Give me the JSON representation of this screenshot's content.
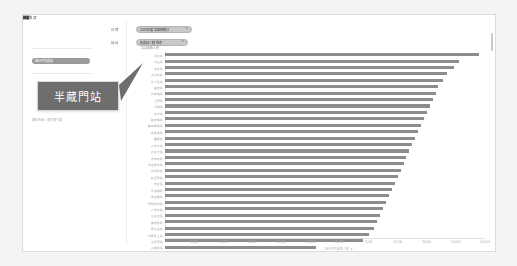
{
  "app": {
    "background_color": "#f4f4f4",
    "card_background": "#ffffff",
    "bar_color": "#8d8d8d",
    "tooltip_background": "#6e6e6e",
    "accent_color": "#9a9a9a"
  },
  "filters": {
    "label_1": "篩選",
    "label_2": "測量方式",
    "label_3": "排序",
    "selected_pill": "每日平均進站",
    "footer_note": "資料來源：東京地下鐵"
  },
  "selectors": {
    "caption_1": "日 期",
    "caption_2": "站 台",
    "dropdown_1_value": "2023年度 全路線統計",
    "dropdown_2_value": "依進站人數 排序",
    "caret": "▾"
  },
  "tooltip": {
    "station_name": "半蔵門站"
  },
  "chart_data": {
    "type": "bar",
    "orientation": "horizontal",
    "title": "各站乘客人數",
    "xlabel": "每日平均乘客人數",
    "ylabel": "",
    "grid": false,
    "legend": false,
    "xlim": [
      0,
      110000
    ],
    "xticks": [
      "10,000",
      "20,000",
      "30,000",
      "40,000",
      "50,000",
      "60,000",
      "70,000",
      "80,000",
      "90,000",
      "100,000",
      "110,000"
    ],
    "categories": [
      "池袋站",
      "新宿站",
      "渋谷站",
      "大手町站",
      "北千住站",
      "銀座站",
      "日本橋站",
      "上野站",
      "新橋站",
      "東京站",
      "飯田橋站",
      "高田馬場站",
      "表參道站",
      "霞關站",
      "六本木站",
      "九段下站",
      "永田町站",
      "赤坂見附站",
      "茅場町站",
      "秋葉原站",
      "市谷站",
      "水道橋站",
      "後樂園站",
      "門前仲町站",
      "人形町站",
      "茗荷谷站",
      "神保町站",
      "惠比壽站",
      "中野坂上站",
      "半蔵門站",
      "三越前站",
      "淡路町站",
      "小川町站",
      "新御茶之水站",
      "竹橋站"
    ],
    "values": [
      108000,
      101000,
      99500,
      97000,
      95500,
      94000,
      93000,
      92000,
      91000,
      90000,
      89000,
      88000,
      87000,
      86000,
      85000,
      84000,
      83000,
      82000,
      81000,
      80000,
      79000,
      78000,
      77000,
      76000,
      75000,
      74000,
      73000,
      72000,
      70000,
      68000,
      52000,
      47000,
      43000,
      22000,
      14000
    ]
  },
  "scrollbar": {
    "visible": true
  }
}
